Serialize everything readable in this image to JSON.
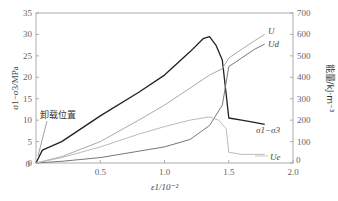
{
  "chart_data": {
    "type": "line",
    "title": "",
    "xlabel": "ε1/10^-2",
    "ylabel_left": "σ1−σ3/MPa",
    "ylabel_right": "能量/kJ·m^-3",
    "xlim": [
      0,
      2.0
    ],
    "ylim_left": [
      0,
      35
    ],
    "ylim_right": [
      0,
      700
    ],
    "x_ticks": [
      "0.5",
      "1.0",
      "1.5",
      "2.0"
    ],
    "y_left_ticks": [
      "0",
      "5",
      "10",
      "15",
      "20",
      "25",
      "30",
      "35"
    ],
    "y_right_ticks": [
      "0",
      "100",
      "200",
      "300",
      "400",
      "500",
      "600",
      "700"
    ],
    "grid": false,
    "annotation": "卸载位置",
    "series": [
      {
        "name": "σ1−σ3",
        "axis": "left",
        "color": "#222222",
        "x": [
          0,
          0.05,
          0.2,
          0.5,
          0.8,
          1.0,
          1.2,
          1.3,
          1.35,
          1.4,
          1.45,
          1.48,
          1.5,
          1.6,
          1.7,
          1.78
        ],
        "y": [
          0,
          3,
          5,
          11,
          16.5,
          20.5,
          26,
          29,
          29.5,
          27.5,
          24,
          16,
          10.5,
          10,
          9.5,
          9
        ]
      },
      {
        "name": "U",
        "axis": "right",
        "color": "#aaaaaa",
        "x": [
          0,
          0.2,
          0.5,
          0.8,
          1.0,
          1.2,
          1.35,
          1.45,
          1.5,
          1.6,
          1.7,
          1.78
        ],
        "y": [
          0,
          30,
          100,
          200,
          270,
          350,
          410,
          440,
          490,
          530,
          570,
          600
        ]
      },
      {
        "name": "Ud",
        "axis": "right",
        "color": "#777777",
        "x": [
          0,
          0.2,
          0.5,
          0.8,
          1.0,
          1.2,
          1.35,
          1.45,
          1.5,
          1.6,
          1.7,
          1.78
        ],
        "y": [
          0,
          8,
          25,
          55,
          75,
          110,
          175,
          270,
          450,
          490,
          530,
          555
        ]
      },
      {
        "name": "Ue",
        "axis": "right",
        "color": "#bbbbbb",
        "x": [
          0,
          0.2,
          0.5,
          0.8,
          1.0,
          1.2,
          1.35,
          1.42,
          1.48,
          1.5,
          1.6,
          1.7,
          1.78
        ],
        "y": [
          0,
          25,
          75,
          135,
          170,
          200,
          215,
          200,
          160,
          50,
          40,
          40,
          40
        ]
      }
    ],
    "labels": {
      "U": "U",
      "Ud": "Ud",
      "Ue": "Ue",
      "stress": "σ1−σ3"
    }
  },
  "axis": {
    "left_title": "σ1−σ3/MPa",
    "right_title": "能量/kJ·m⁻³",
    "x_title": "ε1/10⁻²",
    "x_zero": "0",
    "right_zero": "0"
  }
}
